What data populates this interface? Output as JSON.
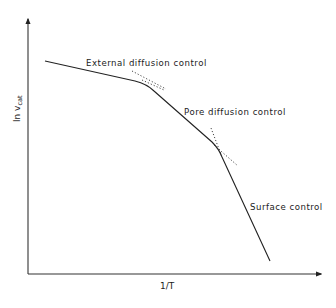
{
  "diagram": {
    "type": "arrhenius-regime-diagram",
    "axes": {
      "x_label": "1/T",
      "y_label_main": "ln v",
      "y_label_sub": "cat"
    },
    "regions": [
      {
        "label": "External diffusion control"
      },
      {
        "label": "Pore diffusion control"
      },
      {
        "label": "Surface control"
      }
    ],
    "colors": {
      "line": "#222222",
      "axis": "#333333",
      "background": "#ffffff"
    }
  }
}
